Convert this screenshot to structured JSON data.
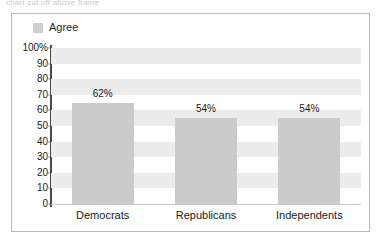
{
  "caption_strip": {
    "text": "chart cut off above frame"
  },
  "legend": {
    "position": "top-left",
    "entries": [
      {
        "label": "Agree",
        "color": "#cbcbcb",
        "swatch_name": "legend-swatch-agree"
      }
    ]
  },
  "colors": {
    "bar": "#cbcbcb",
    "band": "#ececec",
    "axis": "#4a4a4a",
    "frame_border": "#b9b9b9",
    "text": "#1a1a1a",
    "plot_background": "#ffffff"
  },
  "chart_data": {
    "type": "bar",
    "title": "",
    "subtitle": "",
    "xlabel": "",
    "ylabel": "",
    "categories": [
      "Democrats",
      "Republicans",
      "Independents"
    ],
    "values": [
      62,
      54,
      54
    ],
    "value_labels": [
      "62%",
      "54%",
      "54%"
    ],
    "bar_drawn_percent": [
      65,
      55,
      55
    ],
    "series": [
      {
        "name": "Agree",
        "values": [
          62,
          54,
          54
        ]
      }
    ],
    "ylim": [
      0,
      100
    ],
    "ytick_step": 10,
    "ytick_labels": [
      "100%",
      "90",
      "80",
      "70",
      "60",
      "50",
      "40",
      "30",
      "20",
      "10",
      "0"
    ],
    "ytick_values": [
      100,
      90,
      80,
      70,
      60,
      50,
      40,
      30,
      20,
      10,
      0
    ],
    "grid": "horizontal-alternating-bands",
    "legend_position": "top-left",
    "units": "percent"
  }
}
